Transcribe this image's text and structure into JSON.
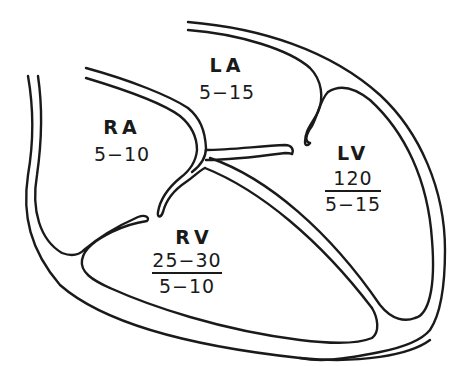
{
  "diagram": {
    "stroke_color": "#1a1a1a",
    "background": "#ffffff"
  },
  "chambers": {
    "ra": {
      "name": "RA",
      "pressure": "5−10"
    },
    "la": {
      "name": "LA",
      "pressure": "5−15"
    },
    "rv": {
      "name": "RV",
      "systolic": "25−30",
      "diastolic": "5−10"
    },
    "lv": {
      "name": "LV",
      "systolic": "120",
      "diastolic": "5−15"
    }
  }
}
